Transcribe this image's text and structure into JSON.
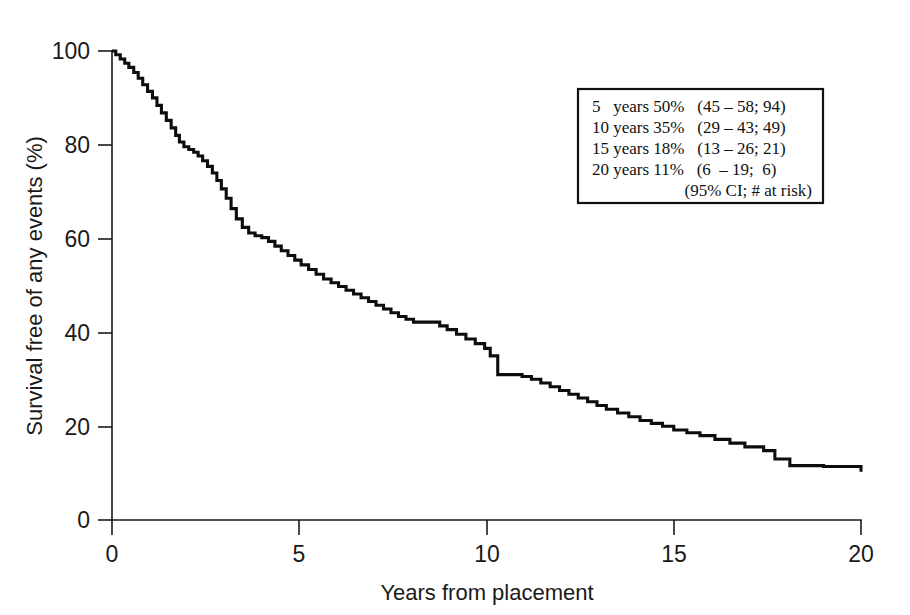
{
  "chart_data": {
    "type": "line",
    "title": "",
    "subtitle": "",
    "xlabel": "Years from placement",
    "ylabel": "Survival free of any events (%)",
    "xlim": [
      0,
      20
    ],
    "ylim": [
      0,
      100
    ],
    "xticks": [
      0,
      5,
      10,
      15,
      20
    ],
    "yticks": [
      0,
      20,
      40,
      60,
      80,
      100
    ],
    "xtick_labels": [
      "0",
      "5",
      "10",
      "15",
      "20"
    ],
    "ytick_labels": [
      "0",
      "20",
      "40",
      "60",
      "80",
      "100"
    ],
    "grid": false,
    "legend_position": "upper-right-inset",
    "series": [
      {
        "name": "Survival free of any events",
        "style": "step-post",
        "color": "#0d0d0d",
        "x": [
          0.0,
          0.1,
          0.22,
          0.34,
          0.45,
          0.58,
          0.7,
          0.82,
          0.95,
          1.08,
          1.2,
          1.32,
          1.45,
          1.58,
          1.7,
          1.8,
          1.92,
          2.05,
          2.18,
          2.3,
          2.42,
          2.55,
          2.68,
          2.8,
          2.92,
          3.05,
          3.18,
          3.32,
          3.48,
          3.65,
          3.82,
          4.0,
          4.18,
          4.35,
          4.52,
          4.7,
          4.88,
          5.05,
          5.25,
          5.45,
          5.65,
          5.85,
          6.05,
          6.25,
          6.45,
          6.65,
          6.85,
          7.05,
          7.25,
          7.45,
          7.65,
          7.85,
          8.05,
          8.55,
          8.75,
          8.95,
          9.2,
          9.45,
          9.7,
          9.95,
          10.1,
          10.3,
          10.95,
          11.2,
          11.45,
          11.7,
          11.95,
          12.2,
          12.45,
          12.7,
          12.95,
          13.2,
          13.5,
          13.8,
          14.1,
          14.4,
          14.7,
          15.0,
          15.35,
          15.7,
          16.1,
          16.5,
          16.9,
          17.4,
          17.7,
          18.1,
          19.0,
          20.0
        ],
        "y": [
          100.0,
          99.2,
          98.3,
          97.4,
          96.5,
          95.4,
          94.2,
          92.8,
          91.4,
          90.0,
          88.4,
          86.8,
          85.2,
          83.6,
          82.0,
          80.6,
          79.6,
          79.0,
          78.4,
          77.6,
          76.6,
          75.4,
          74.0,
          72.4,
          70.6,
          68.6,
          66.4,
          64.2,
          62.4,
          61.2,
          60.6,
          60.2,
          59.4,
          58.4,
          57.4,
          56.4,
          55.4,
          54.4,
          53.4,
          52.4,
          51.4,
          50.6,
          49.8,
          49.0,
          48.2,
          47.4,
          46.6,
          45.8,
          45.0,
          44.2,
          43.4,
          42.8,
          42.2,
          42.2,
          41.4,
          40.6,
          39.6,
          38.6,
          37.6,
          36.6,
          35.0,
          31.0,
          30.6,
          30.0,
          29.2,
          28.4,
          27.6,
          26.8,
          26.0,
          25.2,
          24.4,
          23.6,
          22.8,
          22.0,
          21.2,
          20.6,
          20.0,
          19.2,
          18.6,
          18.0,
          17.2,
          16.4,
          15.6,
          14.8,
          13.0,
          11.6,
          11.4,
          10.3
        ]
      }
    ],
    "annotations": [
      {
        "type": "legend-box",
        "rows": [
          {
            "years": "5",
            "years_word": "years",
            "survival": "50%",
            "ci_risk": "(45 – 58; 94)"
          },
          {
            "years": "10",
            "years_word": "years",
            "survival": "35%",
            "ci_risk": "(29 – 43; 49)"
          },
          {
            "years": "15",
            "years_word": "years",
            "survival": "18%",
            "ci_risk": "(13 – 26; 21)"
          },
          {
            "years": "20",
            "years_word": "years",
            "survival": "11%",
            "ci_risk": "(6  – 19;  6)"
          }
        ],
        "footnote": "(95% CI; # at risk)"
      }
    ]
  },
  "legend": {
    "line_1": "5   years 50%   (45 – 58; 94)",
    "line_2": "10 years 35%   (29 – 43; 49)",
    "line_3": "15 years 18%   (13 – 26; 21)",
    "line_4": "20 years 11%   (6  – 19;  6)",
    "footnote": "(95% CI; # at risk)"
  },
  "axes": {
    "x_title": "Years from placement",
    "y_title": "Survival free of any events (%)",
    "x_tick_0": "0",
    "x_tick_1": "5",
    "x_tick_2": "10",
    "x_tick_3": "15",
    "x_tick_4": "20",
    "y_tick_0": "0",
    "y_tick_1": "20",
    "y_tick_2": "40",
    "y_tick_3": "60",
    "y_tick_4": "80",
    "y_tick_5": "100"
  },
  "colors": {
    "curve": "#0d0d0d",
    "axis": "#1a1a1a",
    "background": "#ffffff",
    "legend_border": "#111111"
  }
}
